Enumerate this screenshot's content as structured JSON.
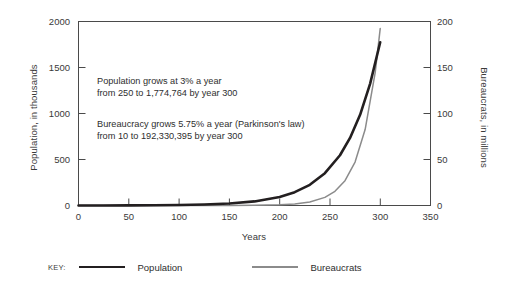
{
  "chart_data": {
    "type": "line",
    "title": "",
    "xlabel": "Years",
    "ylabel": "Population, in thousands",
    "ylabel_right": "Bureaucrats, in millions",
    "xlim": [
      0,
      350
    ],
    "ylim": [
      0,
      2000
    ],
    "ylim_right": [
      0,
      200
    ],
    "grid": false,
    "legend_position": "bottom-left",
    "x_ticks": [
      "0",
      "50",
      "100",
      "150",
      "200",
      "250",
      "300",
      "350"
    ],
    "y_ticks_left": [
      "0",
      "500",
      "1000",
      "1500",
      "2000"
    ],
    "y_ticks_right": [
      "0",
      "50",
      "100",
      "150",
      "200"
    ],
    "annotations": [
      {
        "line1": "Population grows at 3% a year",
        "line2": "from 250 to 1,774,764 by year 300"
      },
      {
        "line1": "Bureaucracy grows 5.75% a year (Parkinson's law)",
        "line2": "from 10 to 192,330,395 by year 300"
      }
    ],
    "series": [
      {
        "name": "Population",
        "color": "#231f20",
        "axis": "left",
        "units": "thousands",
        "start_value": 250,
        "start_value_units": "people",
        "end_value": 1774764,
        "end_value_units": "people",
        "growth_rate_percent": 3,
        "x": [
          0,
          25,
          50,
          75,
          100,
          125,
          150,
          175,
          200,
          215,
          230,
          245,
          260,
          270,
          280,
          290,
          300
        ],
        "values": [
          0.25,
          0.52,
          1.1,
          2.3,
          4.8,
          10.1,
          21.2,
          44.4,
          93,
          145,
          225,
          351,
          546,
          734,
          986,
          1325,
          1775
        ]
      },
      {
        "name": "Bureaucrats",
        "color": "#8b8b8b",
        "axis": "right",
        "units": "millions",
        "start_value": 10,
        "start_value_units": "people",
        "end_value": 192330395,
        "end_value_units": "people",
        "growth_rate_percent": 5.75,
        "x": [
          0,
          25,
          50,
          75,
          100,
          125,
          150,
          175,
          200,
          215,
          230,
          245,
          255,
          265,
          275,
          285,
          295,
          300
        ],
        "values": [
          1e-05,
          4e-05,
          0.00016,
          0.00065,
          0.0026,
          0.0107,
          0.0434,
          0.176,
          0.715,
          1.65,
          3.82,
          8.82,
          15.4,
          27.0,
          47.2,
          82.6,
          144.5,
          192.3
        ]
      }
    ]
  },
  "legend": {
    "key_label": "KEY:",
    "entries": [
      {
        "label": "Population"
      },
      {
        "label": "Bureaucrats"
      }
    ]
  },
  "colors": {
    "population_line": "#231f20",
    "bureaucrats_line": "#8b8b8b",
    "axis": "#4a4a4a",
    "text": "#2e2e2e",
    "background": "#ffffff"
  }
}
